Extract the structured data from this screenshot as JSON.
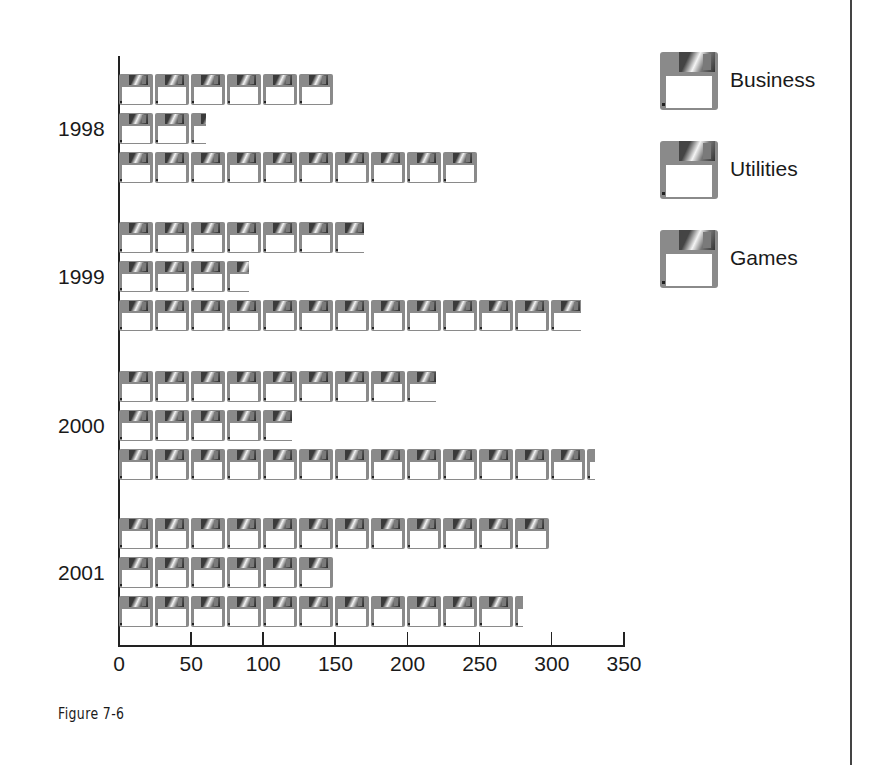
{
  "chart_data": {
    "type": "bar",
    "orientation": "horizontal",
    "style": "pictograph",
    "icon": "floppy-disk-icon",
    "units_per_icon": 25,
    "title": "",
    "xlabel": "",
    "ylabel": "",
    "categories": [
      "1998",
      "1999",
      "2000",
      "2001"
    ],
    "series": [
      {
        "name": "Business",
        "values": [
          150,
          170,
          220,
          300
        ]
      },
      {
        "name": "Utilities",
        "values": [
          60,
          90,
          120,
          150
        ]
      },
      {
        "name": "Games",
        "values": [
          250,
          320,
          330,
          280
        ]
      }
    ],
    "xlim": [
      0,
      350
    ],
    "xticks": [
      "0",
      "50",
      "100",
      "150",
      "200",
      "250",
      "300",
      "350"
    ],
    "grid": false,
    "legend_position": "right"
  },
  "legend": [
    {
      "label": "Business"
    },
    {
      "label": "Utilities"
    },
    {
      "label": "Games"
    }
  ],
  "caption": "Figure 7-6"
}
